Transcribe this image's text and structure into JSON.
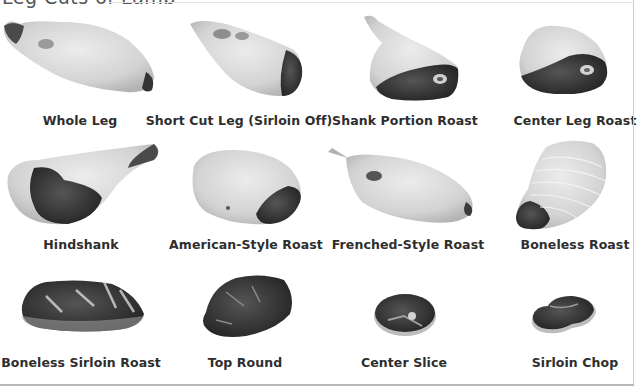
{
  "page": {
    "title": "Leg Cuts of Lamb",
    "colors": {
      "background": "#ffffff",
      "label_text": "#2e2e2e",
      "fat": "#d9d9d9",
      "lean": "#3a3a3a",
      "border": "#b8b8b8"
    }
  },
  "cuts": [
    {
      "row": 1,
      "col": 1,
      "label": "Whole Leg"
    },
    {
      "row": 1,
      "col": 2,
      "label": "Short Cut Leg (Sirloin Off)"
    },
    {
      "row": 1,
      "col": 3,
      "label": "Shank Portion Roast"
    },
    {
      "row": 1,
      "col": 4,
      "label": "Center Leg Roast"
    },
    {
      "row": 2,
      "col": 1,
      "label": "Hindshank"
    },
    {
      "row": 2,
      "col": 2,
      "label": "American-Style Roast"
    },
    {
      "row": 2,
      "col": 3,
      "label": "Frenched-Style Roast"
    },
    {
      "row": 2,
      "col": 4,
      "label": "Boneless Roast"
    },
    {
      "row": 3,
      "col": 1,
      "label": "Boneless Sirloin Roast"
    },
    {
      "row": 3,
      "col": 2,
      "label": "Top Round"
    },
    {
      "row": 3,
      "col": 3,
      "label": "Center Slice"
    },
    {
      "row": 3,
      "col": 4,
      "label": "Sirloin Chop"
    }
  ]
}
